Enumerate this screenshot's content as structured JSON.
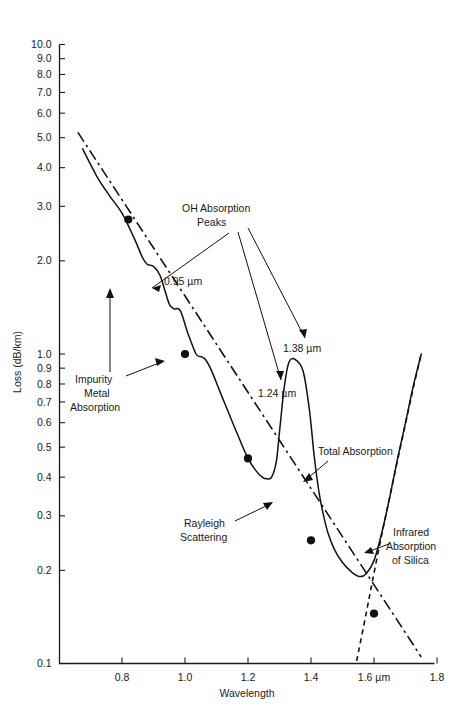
{
  "chart_data": {
    "type": "line",
    "title": "",
    "xlabel": "Wavelength",
    "ylabel": "Loss (dB/km)",
    "xlim": [
      0.62,
      1.8
    ],
    "ylim": [
      0.1,
      10.0
    ],
    "yscale": "log",
    "xticks": [
      "0.8",
      "1.0",
      "1.2",
      "1.4",
      "1.6 µm",
      "1.8"
    ],
    "xtick_values": [
      0.8,
      1.0,
      1.2,
      1.4,
      1.6,
      1.8
    ],
    "yticks": [
      "10.0",
      "9.0",
      "8.0",
      "7.0",
      "6.0",
      "5.0",
      "4.0",
      "3.0",
      "2.0",
      "1.0",
      "0.9",
      "0.8",
      "0.7",
      "0.6",
      "0.5",
      "0.4",
      "0.3",
      "0.2",
      "0.1"
    ],
    "ytick_values": [
      10.0,
      9.0,
      8.0,
      7.0,
      6.0,
      5.0,
      4.0,
      3.0,
      2.0,
      1.0,
      0.9,
      0.8,
      0.7,
      0.6,
      0.5,
      0.4,
      0.3,
      0.2,
      0.1
    ],
    "grid": false,
    "legend": "none",
    "series": [
      {
        "name": "Total Absorption",
        "style": "solid",
        "x": [
          0.675,
          0.72,
          0.76,
          0.8,
          0.84,
          0.865,
          0.88,
          0.9,
          0.92,
          0.935,
          0.95,
          0.965,
          0.985,
          1.01,
          1.035,
          1.05,
          1.065,
          1.085,
          1.11,
          1.14,
          1.17,
          1.2,
          1.225,
          1.245,
          1.26,
          1.275,
          1.29,
          1.3,
          1.315,
          1.33,
          1.35,
          1.375,
          1.395,
          1.41,
          1.425,
          1.44,
          1.455,
          1.475,
          1.5,
          1.53,
          1.555,
          1.575,
          1.6,
          1.625,
          1.65,
          1.675,
          1.7,
          1.725,
          1.75
        ],
        "y": [
          4.6,
          3.75,
          3.25,
          2.85,
          2.35,
          2.05,
          1.95,
          1.92,
          1.8,
          1.62,
          1.45,
          1.4,
          1.38,
          1.16,
          1.0,
          0.98,
          0.96,
          0.88,
          0.76,
          0.64,
          0.54,
          0.46,
          0.42,
          0.4,
          0.395,
          0.4,
          0.45,
          0.56,
          0.78,
          0.94,
          0.96,
          0.88,
          0.66,
          0.47,
          0.36,
          0.3,
          0.262,
          0.233,
          0.212,
          0.197,
          0.191,
          0.195,
          0.215,
          0.265,
          0.345,
          0.46,
          0.6,
          0.79,
          1.0
        ]
      },
      {
        "name": "Rayleigh Scattering",
        "style": "dash-dot",
        "x": [
          0.66,
          1.75
        ],
        "y": [
          5.2,
          0.105
        ]
      },
      {
        "name": "Infrared Absorption of Silica",
        "style": "dashed",
        "x": [
          1.545,
          1.575,
          1.6,
          1.625,
          1.65,
          1.675,
          1.7,
          1.725,
          1.75
        ],
        "y": [
          0.102,
          0.145,
          0.196,
          0.262,
          0.345,
          0.455,
          0.595,
          0.78,
          1.0
        ]
      }
    ],
    "markers": [
      {
        "x": 0.82,
        "y": 2.72
      },
      {
        "x": 1.0,
        "y": 1.0
      },
      {
        "x": 1.2,
        "y": 0.46
      },
      {
        "x": 1.4,
        "y": 0.25
      },
      {
        "x": 1.6,
        "y": 0.145
      }
    ],
    "annotations": [
      {
        "id": "oh-absorption-peaks",
        "text": "OH Absorption\nPeaks",
        "line1": "OH Absorption",
        "line2": "Peaks"
      },
      {
        "id": "peak-095",
        "text": "0.95 µm"
      },
      {
        "id": "peak-124",
        "text": "1.24 µm"
      },
      {
        "id": "peak-138",
        "text": "1.38 µm"
      },
      {
        "id": "impurity-metal-absorption",
        "line1": "Impurity",
        "line2": "Metal",
        "line3": "Absorption"
      },
      {
        "id": "total-absorption",
        "text": "Total Absorption"
      },
      {
        "id": "rayleigh-scattering",
        "line1": "Rayleigh",
        "line2": "Scattering"
      },
      {
        "id": "infrared-absorption-of-silica",
        "line1": "Infrared",
        "line2": "Absorption",
        "line3": "of Silica"
      }
    ]
  },
  "axes": {
    "ylabel": "Loss (dB/km)",
    "xlabel": "Wavelength",
    "ytick_labels": [
      "10.0",
      "9.0",
      "8.0",
      "7.0",
      "6.0",
      "5.0",
      "4.0",
      "3.0",
      "2.0",
      "1.0",
      "0.9",
      "0.8",
      "0.7",
      "0.6",
      "0.5",
      "0.4",
      "0.3",
      "0.2",
      "0.1"
    ],
    "xtick_labels": [
      "0.8",
      "1.0",
      "1.2",
      "1.4",
      "1.6 µm",
      "1.8"
    ]
  },
  "labels": {
    "oh_line1": "OH Absorption",
    "oh_line2": "Peaks",
    "p095": "0.95 µm",
    "p124": "1.24 µm",
    "p138": "1.38 µm",
    "impurity_line1": "Impurity",
    "impurity_line2": "Metal",
    "impurity_line3": "Absorption",
    "total_absorption": "Total Absorption",
    "rayleigh_line1": "Rayleigh",
    "rayleigh_line2": "Scattering",
    "infrared_line1": "Infrared",
    "infrared_line2": "Absorption",
    "infrared_line3": "of Silica"
  },
  "colors": {
    "ink": "#111111",
    "background": "#ffffff"
  }
}
